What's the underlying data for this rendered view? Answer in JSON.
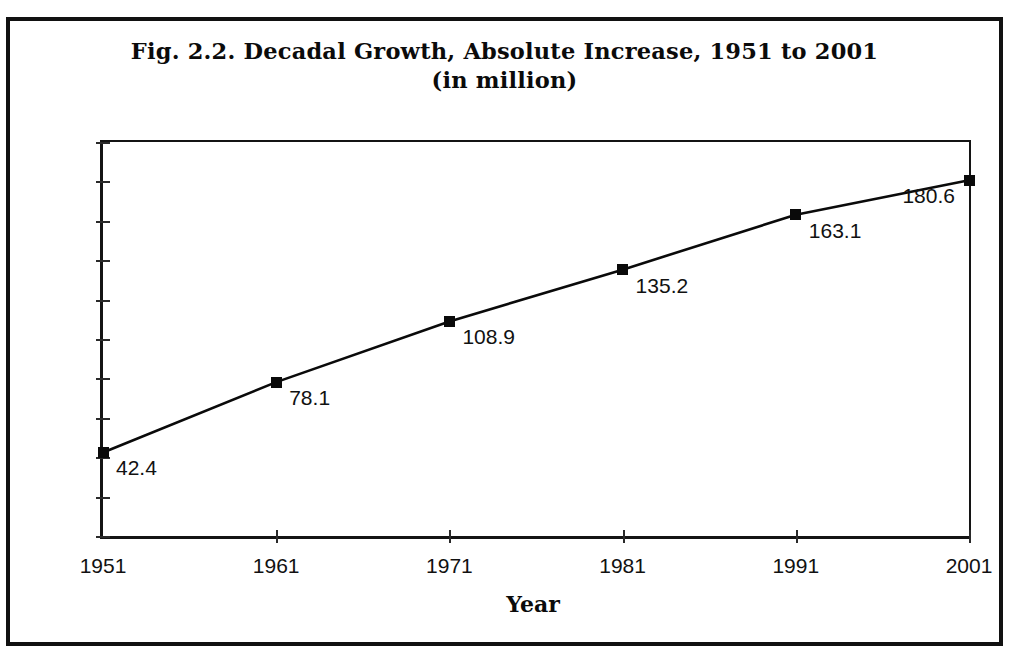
{
  "figure": {
    "title_line1": "Fig. 2.2. Decadal Growth, Absolute Increase, 1951 to 2001",
    "title_line2": "(in million)",
    "border_color": "#111111"
  },
  "chart_data": {
    "type": "line",
    "title": "Fig. 2.2. Decadal Growth, Absolute Increase, 1951 to 2001 (in million)",
    "subtitle": "(in million)",
    "xlabel": "Year",
    "ylabel": "",
    "categories": [
      "1951",
      "1961",
      "1971",
      "1981",
      "1991",
      "2001"
    ],
    "x": [
      1951,
      1961,
      1971,
      1981,
      1991,
      2001
    ],
    "values": [
      42.4,
      78.1,
      108.9,
      135.2,
      163.1,
      180.6
    ],
    "point_labels": [
      "42.4",
      "78.1",
      "108.9",
      "135.2",
      "163.1",
      "180.6"
    ],
    "label_side": [
      "right",
      "right",
      "right",
      "right",
      "right",
      "left"
    ],
    "ylim": [
      0,
      200
    ],
    "ytick_step": 20,
    "ytick_labels": [
      "0.0",
      "20.0",
      "40.0",
      "60.0",
      "80.0",
      "100.0",
      "120.0",
      "140.0",
      "160.0",
      "180.0",
      "200.0"
    ],
    "ytick_values": [
      0,
      20,
      40,
      60,
      80,
      100,
      120,
      140,
      160,
      180,
      200
    ],
    "xtick_labels": [
      "1951",
      "1961",
      "1971",
      "1981",
      "1991",
      "2001"
    ],
    "grid": false,
    "legend": false,
    "series": [
      {
        "name": "Absolute Increase (in million)",
        "values": [
          42.4,
          78.1,
          108.9,
          135.2,
          163.1,
          180.6
        ],
        "marker": "filled-square",
        "color": "#0a0a0a"
      }
    ]
  }
}
